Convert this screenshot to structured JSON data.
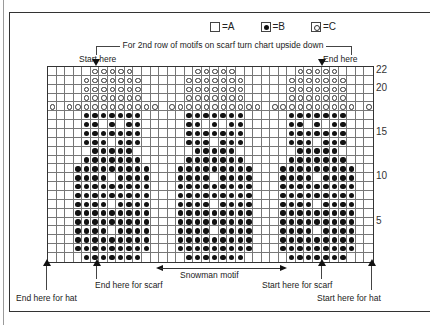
{
  "legend": [
    {
      "symbol": "empty-square",
      "label": "=A"
    },
    {
      "symbol": "filled-dot",
      "label": "=B"
    },
    {
      "symbol": "open-circle",
      "label": "=C"
    }
  ],
  "bracket_note": "For 2nd row of motifs on scarf turn chart upside down",
  "top_markers": {
    "start": "Start here",
    "end": "End here"
  },
  "bottom_markers": {
    "end_hat": "End here for hat",
    "end_scarf": "End here for scarf",
    "motif": "Snowman motif",
    "start_scarf": "Start here for scarf",
    "start_hat": "Start here for hat"
  },
  "row_numbers": [
    {
      "label": "22",
      "row": 22
    },
    {
      "label": "20",
      "row": 20
    },
    {
      "label": "15",
      "row": 15
    },
    {
      "label": "10",
      "row": 10
    },
    {
      "label": "5",
      "row": 5
    }
  ],
  "chart_data": {
    "type": "knitting-chart",
    "columns": 38,
    "rows": 22,
    "motif_repeat": 12,
    "motif_offsets": [
      0,
      12,
      24
    ],
    "key": {
      "A": "empty",
      "B": "filled dot",
      "C": "open circle"
    },
    "row18_pattern": "C.CCCCCCCCCCC.CCCCCCCCCCC.CCCCCCCCCC.C",
    "motif_rows": {
      "22": "..CCCCC..",
      "21": ".CCCCCCC.",
      "20": ".CCCCCCC.",
      "19": ".CCCCCCC.",
      "17": ".BBBBBBB.",
      "16": ".BB.B.BB.",
      "15": ".BBBBBBB.",
      "14": ".BBB.BBB.",
      "13": "..BBBBB..",
      "12": ".BBBBBBB.",
      "11": "BBBBBBBBB",
      "10": "BBBB.BBBB",
      "9": "BBBBBBBBB",
      "8": "BBBBBBBBB",
      "7": "BBBB.BBBB",
      "6": "BBBBBBBBB",
      "5": "BBBBBBBBB",
      "4": "BBBB.BBBB",
      "3": "BBBBBBBBB",
      "2": "BBBBBBBBB",
      "1": ".BBBBBBB."
    },
    "motif_start_col": 4
  }
}
